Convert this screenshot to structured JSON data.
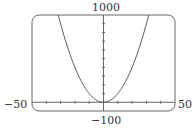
{
  "chart_data": {
    "type": "line",
    "title": "",
    "function": "y = x^2",
    "series": [
      {
        "name": "y = x^2",
        "x": [
          -32,
          -30,
          -25,
          -20,
          -15,
          -10,
          -5,
          0,
          5,
          10,
          15,
          20,
          25,
          30,
          32
        ],
        "values": [
          1024,
          900,
          625,
          400,
          225,
          100,
          25,
          0,
          25,
          100,
          225,
          400,
          625,
          900,
          1024
        ]
      }
    ],
    "xlim": [
      -50,
      50
    ],
    "ylim": [
      -100,
      1000
    ],
    "xlabel": "",
    "ylabel": "",
    "x_tick_spacing": 10,
    "y_tick_spacing": 100,
    "grid": false,
    "labels": {
      "x_min": "−50",
      "x_max": "50",
      "y_max": "1000",
      "y_min": "−100"
    }
  },
  "labels": {
    "x_min": "−50",
    "x_max": "50",
    "y_max": "1000",
    "y_min": "−100"
  }
}
